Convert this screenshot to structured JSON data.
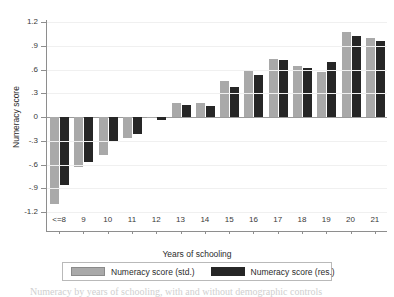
{
  "chart_data": {
    "type": "bar",
    "title": "",
    "xlabel": "Years of schooling",
    "ylabel": "Numeracy score",
    "categories": [
      "<=8",
      "9",
      "10",
      "11",
      "12",
      "13",
      "14",
      "15",
      "16",
      "17",
      "18",
      "19",
      "20",
      "21"
    ],
    "series": [
      {
        "name": "Numeracy score (std.)",
        "color": "#a9a9a9",
        "values": [
          -1.1,
          -0.63,
          -0.48,
          -0.27,
          -0.01,
          0.18,
          0.18,
          0.45,
          0.6,
          0.73,
          0.65,
          0.57,
          1.07,
          1.0
        ]
      },
      {
        "name": "Numeracy score (res.)",
        "color": "#262626",
        "values": [
          -0.86,
          -0.57,
          -0.31,
          -0.22,
          -0.04,
          0.15,
          0.14,
          0.38,
          0.53,
          0.72,
          0.62,
          0.7,
          1.02,
          0.96
        ]
      }
    ],
    "ylim": [
      -1.2,
      1.2
    ],
    "yticks": [
      1.2,
      0.9,
      0.6,
      0.3,
      0,
      -0.3,
      -0.6,
      -0.9,
      -1.2
    ],
    "ytick_labels": [
      "1.2",
      ".9",
      ".6",
      ".3",
      "0",
      "-.3",
      "-.6",
      "-.9",
      "-1.2"
    ],
    "grid": true,
    "legend_position": "bottom"
  },
  "legend": {
    "items": [
      {
        "label": "Numeracy score (std.)",
        "swatch": "gray-swatch"
      },
      {
        "label": "Numeracy score (res.)",
        "swatch": "black-swatch"
      }
    ]
  },
  "caption": {
    "text": "Numeracy by years of schooling, with and without demographic controls"
  }
}
